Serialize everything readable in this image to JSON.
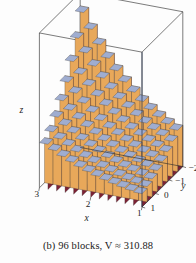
{
  "figure": {
    "type": "3d-riemann-sum-block-plot",
    "caption": {
      "prefix": "(b) 96 blocks,",
      "volume_symbol": "V",
      "approx_sign": "≈",
      "volume_value": "310.88",
      "full_text": "(b) 96 blocks, V ≈ 310.88"
    },
    "axes": {
      "x": {
        "label": "x",
        "ticks": [
          "3",
          "2",
          "1"
        ]
      },
      "y": {
        "label": "y",
        "ticks": [
          "-2",
          "-1",
          "0",
          "1"
        ]
      },
      "z": {
        "label": "z",
        "ticks": []
      }
    },
    "colors": {
      "block_front": "#7d2234",
      "block_front_dark": "#6a1b2b",
      "block_side": "#e8a85a",
      "block_side_dark": "#d18f42",
      "block_top": "#9fadd0",
      "block_top_light": "#b3bfdd",
      "outline": "#3a3a3a",
      "frame": "#2b2b2b",
      "background": "#fdfdfd",
      "text": "#1a1a1a"
    },
    "grid": {
      "nx": 12,
      "ny": 8,
      "block_count": 96
    }
  },
  "chart_data": {
    "type": "bar",
    "title": "(b) 96 blocks, V ≈ 310.88",
    "xlabel": "x",
    "ylabel": "y",
    "zlabel": "z",
    "xlim": [
      1,
      3
    ],
    "ylim": [
      -2,
      1
    ],
    "xticks": [
      "3",
      "2",
      "1"
    ],
    "yticks": [
      "-2",
      "-1",
      "0",
      "1"
    ],
    "nx": 12,
    "ny": 8,
    "total_blocks": 96,
    "volume_estimate": 310.88,
    "grid": true,
    "legend": "none",
    "heights": [
      [
        1.0,
        1.15,
        1.35,
        1.6,
        1.9,
        2.25,
        2.65,
        3.1
      ],
      [
        1.1,
        1.28,
        1.5,
        1.78,
        2.12,
        2.5,
        2.95,
        3.45
      ],
      [
        1.22,
        1.42,
        1.68,
        1.98,
        2.35,
        2.78,
        3.28,
        3.85
      ],
      [
        1.36,
        1.58,
        1.87,
        2.21,
        2.62,
        3.1,
        3.65,
        4.28
      ],
      [
        1.52,
        1.77,
        2.09,
        2.47,
        2.93,
        3.46,
        4.07,
        4.78
      ],
      [
        1.7,
        1.98,
        2.34,
        2.77,
        3.28,
        3.87,
        4.56,
        5.35
      ],
      [
        1.91,
        2.22,
        2.62,
        3.1,
        3.67,
        4.34,
        5.11,
        5.99
      ],
      [
        2.14,
        2.49,
        2.94,
        3.48,
        4.12,
        4.86,
        5.73,
        6.72
      ],
      [
        2.4,
        2.79,
        3.3,
        3.9,
        4.62,
        5.45,
        6.42,
        7.53
      ],
      [
        2.69,
        3.13,
        3.7,
        4.38,
        5.18,
        6.11,
        7.2,
        8.44
      ],
      [
        3.02,
        3.51,
        4.15,
        4.91,
        5.81,
        6.85,
        8.07,
        9.46
      ],
      [
        3.38,
        3.93,
        4.65,
        5.5,
        6.51,
        7.68,
        9.05,
        10.6
      ]
    ]
  }
}
